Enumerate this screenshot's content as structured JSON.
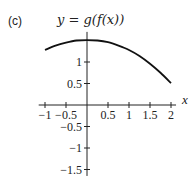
{
  "panel_label": "(c)",
  "title": "y = g(f(x))",
  "chart_data": {
    "type": "line",
    "title": "y = g(f(x))",
    "xlabel": "x",
    "ylabel": "",
    "xlim": [
      -1.1,
      2.1
    ],
    "ylim": [
      -1.6,
      1.6
    ],
    "grid": false,
    "x_ticks": [
      -1,
      -0.5,
      0.5,
      1,
      1.5,
      2
    ],
    "x_tick_labels": [
      "−1",
      "−0.5",
      "0.5",
      "1",
      "1.5",
      "2"
    ],
    "y_ticks": [
      1,
      0.5,
      -0.5,
      -1,
      -1.5
    ],
    "y_tick_labels": [
      "1",
      "0.5",
      "−0.5",
      "−1",
      "−1.5"
    ],
    "series": [
      {
        "name": "g(f(x))",
        "x": [
          -1,
          -0.75,
          -0.5,
          -0.25,
          0,
          0.25,
          0.5,
          0.75,
          1,
          1.25,
          1.5,
          1.75,
          2
        ],
        "y": [
          1.28,
          1.38,
          1.45,
          1.5,
          1.51,
          1.5,
          1.46,
          1.38,
          1.28,
          1.14,
          0.96,
          0.75,
          0.51
        ]
      }
    ]
  }
}
